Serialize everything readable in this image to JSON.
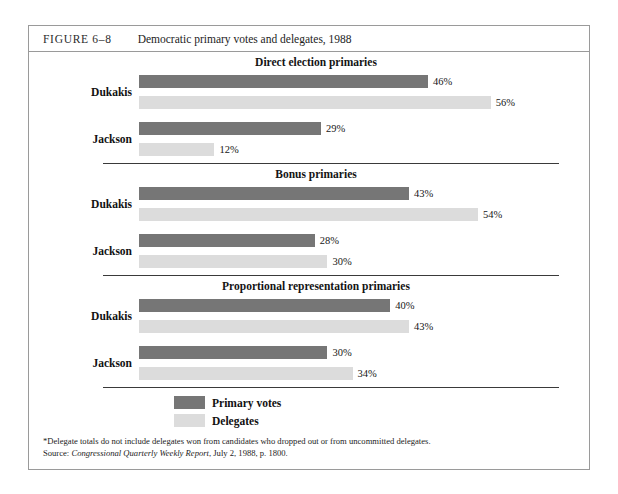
{
  "figure": {
    "label": "FIGURE 6–8",
    "title": "Democratic primary votes and delegates, 1988"
  },
  "colors": {
    "primary_votes": "#767676",
    "delegates": "#dcdcdc",
    "rule": "#3a3a3a",
    "frame": "#9a9a9a"
  },
  "legend": {
    "items": [
      {
        "label": "Primary votes",
        "key": "votes"
      },
      {
        "label": "Delegates",
        "key": "delegates"
      }
    ]
  },
  "notes": {
    "footnote": "*Delegate totals do not include delegates won from candidates who dropped out or from uncommitted delegates.",
    "source_prefix": "Source: ",
    "source_italic": "Congressional Quarterly Weekly Report",
    "source_suffix": ", July 2, 1988, p. 1800."
  },
  "chart_data": {
    "type": "bar",
    "title": "Democratic primary votes and delegates, 1988",
    "xlabel": "",
    "ylabel": "",
    "orientation": "horizontal",
    "xlim": [
      0,
      60
    ],
    "grid": false,
    "legend_position": "bottom-left",
    "value_unit": "%",
    "series": [
      {
        "name": "Primary votes",
        "color": "#767676"
      },
      {
        "name": "Delegates",
        "color": "#dcdcdc"
      }
    ],
    "panels": [
      {
        "title": "Direct election primaries",
        "categories": [
          "Dukakis",
          "Jackson"
        ],
        "groups": [
          {
            "category": "Dukakis",
            "bars": [
              {
                "series": "Primary votes",
                "value": 46,
                "label": "46%"
              },
              {
                "series": "Delegates",
                "value": 56,
                "label": "56%"
              }
            ]
          },
          {
            "category": "Jackson",
            "bars": [
              {
                "series": "Primary votes",
                "value": 29,
                "label": "29%"
              },
              {
                "series": "Delegates",
                "value": 12,
                "label": "12%"
              }
            ]
          }
        ]
      },
      {
        "title": "Bonus primaries",
        "categories": [
          "Dukakis",
          "Jackson"
        ],
        "groups": [
          {
            "category": "Dukakis",
            "bars": [
              {
                "series": "Primary votes",
                "value": 43,
                "label": "43%"
              },
              {
                "series": "Delegates",
                "value": 54,
                "label": "54%"
              }
            ]
          },
          {
            "category": "Jackson",
            "bars": [
              {
                "series": "Primary votes",
                "value": 28,
                "label": "28%"
              },
              {
                "series": "Delegates",
                "value": 30,
                "label": "30%"
              }
            ]
          }
        ]
      },
      {
        "title": "Proportional representation primaries",
        "categories": [
          "Dukakis",
          "Jackson"
        ],
        "groups": [
          {
            "category": "Dukakis",
            "bars": [
              {
                "series": "Primary votes",
                "value": 40,
                "label": "40%"
              },
              {
                "series": "Delegates",
                "value": 43,
                "label": "43%"
              }
            ]
          },
          {
            "category": "Jackson",
            "bars": [
              {
                "series": "Primary votes",
                "value": 30,
                "label": "30%"
              },
              {
                "series": "Delegates",
                "value": 34,
                "label": "34%"
              }
            ]
          }
        ]
      }
    ]
  }
}
